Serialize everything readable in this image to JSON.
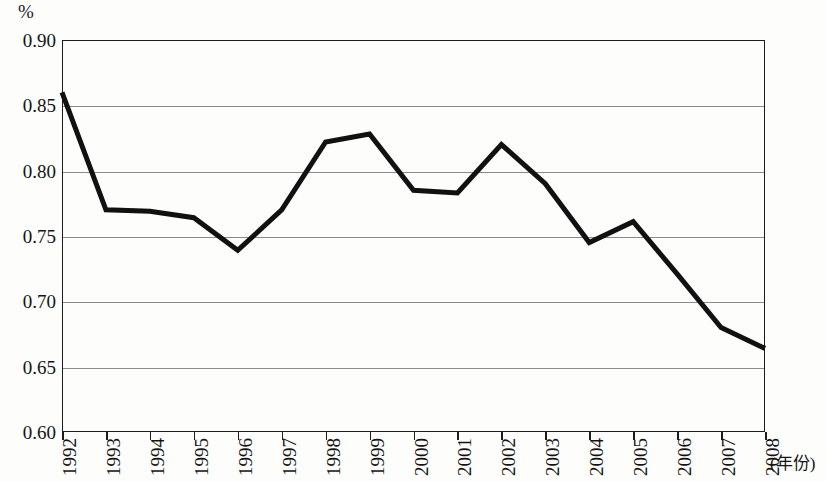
{
  "chart_data": {
    "type": "line",
    "title": "",
    "xlabel": "(年份)",
    "ylabel": "%",
    "unit_label": "%",
    "x": [
      1992,
      1993,
      1994,
      1995,
      1996,
      1997,
      1998,
      1999,
      2000,
      2001,
      2002,
      2003,
      2004,
      2005,
      2006,
      2007,
      2008
    ],
    "categories": [
      "1992",
      "1993",
      "1994",
      "1995",
      "1996",
      "1997",
      "1998",
      "1999",
      "2000",
      "2001",
      "2002",
      "2003",
      "2004",
      "2005",
      "2006",
      "2007",
      "2008"
    ],
    "values": [
      0.86,
      0.77,
      0.769,
      0.764,
      0.739,
      0.77,
      0.822,
      0.828,
      0.785,
      0.783,
      0.82,
      0.79,
      0.745,
      0.761,
      0.721,
      0.68,
      0.664
    ],
    "series": [
      {
        "name": "",
        "values": [
          0.86,
          0.77,
          0.769,
          0.764,
          0.739,
          0.77,
          0.822,
          0.828,
          0.785,
          0.783,
          0.82,
          0.79,
          0.745,
          0.761,
          0.721,
          0.68,
          0.664
        ]
      }
    ],
    "ylim": [
      0.6,
      0.9
    ],
    "yticks": [
      0.9,
      0.85,
      0.8,
      0.75,
      0.7,
      0.65,
      0.6
    ],
    "ytick_labels": [
      "0.90",
      "0.85",
      "0.80",
      "0.75",
      "0.70",
      "0.65",
      "0.60"
    ],
    "grid": true,
    "grid_axis": "y",
    "legend": false,
    "legend_position": "none",
    "line_color": "#111111",
    "grid_color": "#8a8a8a",
    "frame_color": "#1c1c1c",
    "background_color": "#fdfdfc"
  }
}
